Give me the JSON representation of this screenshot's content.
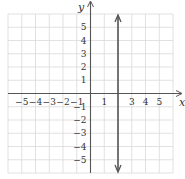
{
  "chart_data": {
    "type": "line",
    "title": "",
    "xlabel": "x",
    "ylabel": "y",
    "xlim": [
      -6,
      6
    ],
    "ylim": [
      -6,
      6
    ],
    "grid": true,
    "x_ticks": [
      "-5",
      "-4",
      "-3",
      "-2",
      "-1",
      "1",
      "3",
      "4",
      "5"
    ],
    "y_ticks": [
      "5",
      "4",
      "3",
      "2",
      "1",
      "-1",
      "-2",
      "-3",
      "-4",
      "-5"
    ],
    "series": [
      {
        "name": "x = 2",
        "type": "vertical-line",
        "x": 2,
        "arrows": "both",
        "color": "#555555"
      }
    ]
  },
  "labels": {
    "x": "x",
    "y": "y"
  }
}
